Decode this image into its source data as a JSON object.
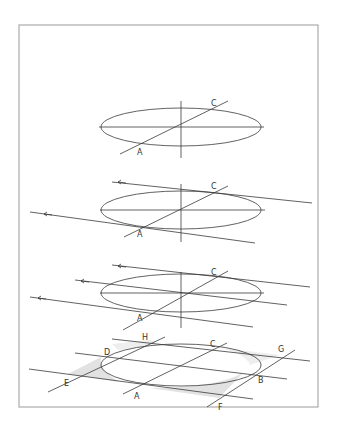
{
  "figure": {
    "frame": {
      "x": 19,
      "y": 25,
      "width": 299,
      "height": 382,
      "stroke": "#9a9a9a"
    },
    "ink_color": "#3a3a3a",
    "shade_color": "#dcdcdc",
    "steps": [
      {
        "id": "step-1",
        "ellipse": {
          "cx": 181,
          "cy": 127,
          "rx": 80,
          "ry": 19
        },
        "labels": [
          {
            "text": "C",
            "x": 212,
            "y": 106
          },
          {
            "text": "A",
            "x": 138,
            "y": 155
          }
        ]
      },
      {
        "id": "step-2",
        "ellipse": {
          "cx": 181,
          "cy": 210,
          "rx": 80,
          "ry": 19
        },
        "labels": [
          {
            "text": "C",
            "x": 211,
            "y": 189
          },
          {
            "text": "A",
            "x": 137,
            "y": 237
          }
        ]
      },
      {
        "id": "step-3",
        "ellipse": {
          "cx": 181,
          "cy": 293,
          "rx": 80,
          "ry": 19
        },
        "labels": [
          {
            "text": "C",
            "x": 211,
            "y": 275
          },
          {
            "text": "A",
            "x": 137,
            "y": 321
          }
        ]
      },
      {
        "id": "step-4",
        "ellipse": {
          "cx": 181,
          "cy": 365,
          "rx": 80,
          "ry": 21
        },
        "labels": [
          {
            "text": "H",
            "x": 142,
            "y": 340
          },
          {
            "text": "C",
            "x": 210,
            "y": 347
          },
          {
            "text": "G",
            "x": 278,
            "y": 352
          },
          {
            "text": "D",
            "x": 104,
            "y": 355
          },
          {
            "text": "E",
            "x": 64,
            "y": 386
          },
          {
            "text": "A",
            "x": 134,
            "y": 399
          },
          {
            "text": "B",
            "x": 258,
            "y": 383
          },
          {
            "text": "F",
            "x": 218,
            "y": 410
          }
        ]
      }
    ]
  }
}
